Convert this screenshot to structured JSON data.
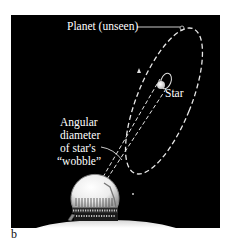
{
  "figure": {
    "panel_letter": "b",
    "colors": {
      "background": "#000000",
      "foreground": "#ffffff",
      "page": "#ffffff",
      "dome_fill": "#f2f2f2",
      "ground": "#e8e8e8"
    },
    "labels": {
      "planet": "Planet (unseen)",
      "star": "Star",
      "wobble_line1": "Angular",
      "wobble_line2": "diameter",
      "wobble_line3": "of star's",
      "wobble_line4": "“wobble”"
    },
    "elements": {
      "planet_orbit": "large dashed ellipse orbit of unseen planet",
      "star_orbit": "small solid ellipse orbit of star wobble",
      "sight_lines": "two dashed lines from telescope to star",
      "observatory": "domed observatory telescope"
    }
  }
}
